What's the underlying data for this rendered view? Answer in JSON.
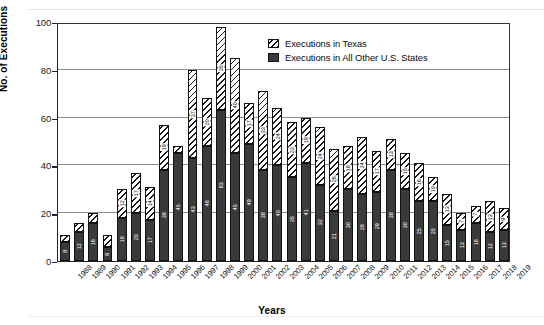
{
  "chart_data": {
    "type": "bar",
    "subtype": "stacked-bar",
    "title": "",
    "xlabel": "Years",
    "ylabel": "No. of Executions",
    "ylim": [
      0,
      100
    ],
    "yticks": [
      0,
      20,
      40,
      60,
      80,
      100
    ],
    "grid": true,
    "grid_axis": "y",
    "legend_position": "upper-right-inside",
    "categories": [
      "1988",
      "1989",
      "1990",
      "1991",
      "1992",
      "1993",
      "1994",
      "1995",
      "1996",
      "1997",
      "1998",
      "1999",
      "2000",
      "2001",
      "2002",
      "2003",
      "2004",
      "2005",
      "2006",
      "2007",
      "2008",
      "2009",
      "2010",
      "2011",
      "2012",
      "2013",
      "2014",
      "2015",
      "2016",
      "2017",
      "2018",
      "2019"
    ],
    "series": [
      {
        "name": "Executions in All Other U.S. States",
        "color": "#3a3a3a",
        "pattern": "solid",
        "values": [
          8,
          12,
          16,
          6,
          18,
          20,
          17,
          38,
          45,
          43,
          48,
          63,
          45,
          49,
          38,
          40,
          35,
          41,
          32,
          21,
          30,
          28,
          29,
          38,
          30,
          25,
          25,
          15,
          13,
          16,
          12,
          13
        ]
      },
      {
        "name": "Executions in Texas",
        "color": "#ffffff",
        "pattern": "diagonal-hatch",
        "values": [
          3,
          4,
          4,
          5,
          12,
          17,
          14,
          19,
          3,
          37,
          20,
          35,
          40,
          17,
          33,
          24,
          23,
          19,
          24,
          26,
          18,
          24,
          17,
          13,
          15,
          16,
          10,
          13,
          7,
          7,
          13,
          9
        ]
      }
    ],
    "totals": [
      11,
      16,
      20,
      11,
      30,
      37,
      31,
      57,
      48,
      80,
      68,
      98,
      85,
      66,
      71,
      64,
      58,
      60,
      56,
      47,
      48,
      52,
      46,
      51,
      45,
      41,
      35,
      28,
      20,
      23,
      25,
      22
    ]
  },
  "legend": {
    "entries": [
      {
        "label": "Executions in Texas",
        "swatch": "diagonal-hatch-swatch"
      },
      {
        "label": "Executions in All Other U.S. States",
        "swatch": "solid-dark-swatch"
      }
    ]
  },
  "axes": {
    "y_axis_title": "No. of Executions",
    "x_axis_title": "Years",
    "y_tick_labels": [
      "0",
      "20",
      "40",
      "60",
      "80",
      "100"
    ]
  }
}
